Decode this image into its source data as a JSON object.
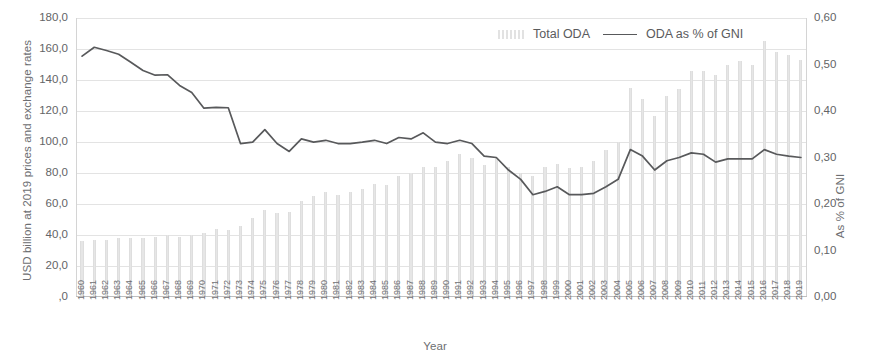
{
  "chart_data": {
    "type": "bar",
    "title": "",
    "xlabel": "Year",
    "ylabel": "USD billion at 2019 prices and exchange rates",
    "y2label": "As % of GNI",
    "grid": true,
    "legend_position": "top-right",
    "ylim": [
      0,
      180
    ],
    "y2lim": [
      0.0,
      0.6
    ],
    "ytick_labels": [
      "180,0",
      "160,0",
      "140,0",
      "120,0",
      "100,0",
      "80,0",
      "60,0",
      "40,0",
      "20,0",
      ",0"
    ],
    "ytick_values": [
      180,
      160,
      140,
      120,
      100,
      80,
      60,
      40,
      20,
      0
    ],
    "y2tick_labels": [
      "0,60",
      "0,50",
      "0,40",
      "0,30",
      "0,20",
      "0,10",
      "0,00"
    ],
    "y2tick_values": [
      0.6,
      0.5,
      0.4,
      0.3,
      0.2,
      0.1,
      0.0
    ],
    "categories": [
      "1960",
      "1961",
      "1962",
      "1963",
      "1964",
      "1965",
      "1966",
      "1967",
      "1968",
      "1969",
      "1970",
      "1971",
      "1972",
      "1973",
      "1974",
      "1975",
      "1976",
      "1977",
      "1978",
      "1979",
      "1980",
      "1981",
      "1982",
      "1983",
      "1984",
      "1985",
      "1986",
      "1987",
      "1988",
      "1989",
      "1990",
      "1991",
      "1992",
      "1993",
      "1994",
      "1995",
      "1996",
      "1997",
      "1998",
      "1999",
      "2000",
      "2001",
      "2002",
      "2003",
      "2004",
      "2005",
      "2006",
      "2007",
      "2008",
      "2009",
      "2010",
      "2011",
      "2012",
      "2013",
      "2014",
      "2015",
      "2016",
      "2017",
      "2018",
      "2019"
    ],
    "series": [
      {
        "name": "Total ODA",
        "axis": "left",
        "render": "bar",
        "color": "#e6e6e6",
        "values": [
          36,
          37,
          37,
          38,
          38,
          38,
          39,
          40,
          39,
          40,
          41,
          44,
          43,
          46,
          51,
          56,
          54,
          55,
          62,
          65,
          68,
          66,
          68,
          70,
          73,
          72,
          78,
          80,
          84,
          84,
          88,
          92,
          90,
          85,
          90,
          84,
          80,
          78,
          84,
          86,
          83,
          84,
          88,
          95,
          100,
          135,
          128,
          117,
          130,
          134,
          146,
          146,
          143,
          150,
          152,
          150,
          165,
          158,
          156,
          153
        ]
      },
      {
        "name": "ODA as % of GNI",
        "axis": "right",
        "render": "line",
        "color": "#58595b",
        "values": [
          0.518,
          0.537,
          0.53,
          0.522,
          0.505,
          0.487,
          0.477,
          0.478,
          0.455,
          0.44,
          0.406,
          0.408,
          0.407,
          0.33,
          0.333,
          0.36,
          0.33,
          0.313,
          0.34,
          0.333,
          0.337,
          0.33,
          0.33,
          0.333,
          0.337,
          0.33,
          0.343,
          0.34,
          0.353,
          0.333,
          0.33,
          0.337,
          0.33,
          0.303,
          0.3,
          0.273,
          0.253,
          0.22,
          0.227,
          0.237,
          0.22,
          0.22,
          0.223,
          0.237,
          0.253,
          0.317,
          0.303,
          0.273,
          0.293,
          0.3,
          0.31,
          0.307,
          0.29,
          0.297,
          0.297,
          0.297,
          0.317,
          0.307,
          0.303,
          0.3
        ]
      }
    ]
  },
  "legend": {
    "items": [
      {
        "label": "Total ODA",
        "marker": "bars-swatch"
      },
      {
        "label": "ODA as % of GNI",
        "marker": "line-swatch"
      }
    ]
  },
  "axes": {
    "left_title": "USD billion at 2019 prices and exchange rates",
    "right_title": "As % of GNI",
    "bottom_title": "Year"
  },
  "colors": {
    "bar": "#e6e6e6",
    "line": "#58595b",
    "grid": "#e3e3e3",
    "text": "#636466",
    "background": "#ffffff"
  }
}
